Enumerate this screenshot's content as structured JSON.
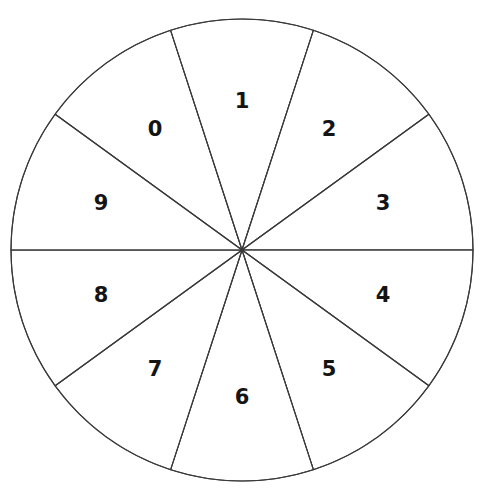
{
  "figure": {
    "name": "numbered-pie-wheel",
    "background_color": "#ffffff",
    "stroke_color": "#3a3a3a",
    "label_color": "#141414",
    "fill_color": "#ffffff"
  },
  "geometry": {
    "center_x": 242,
    "center_y": 250,
    "radius": 231,
    "sector_count": 10,
    "sector_angle_deg": 36,
    "label_radius": 148
  },
  "top_fragments": {
    "left": "",
    "right": ""
  },
  "chart_data": {
    "type": "pie",
    "title": "",
    "subtitle": "",
    "xlabel": "",
    "ylabel": "",
    "grid": false,
    "legend_position": "none",
    "annotations": [],
    "categories": [
      "0",
      "1",
      "2",
      "3",
      "4",
      "5",
      "6",
      "7",
      "8",
      "9"
    ],
    "values": [
      10,
      10,
      10,
      10,
      10,
      10,
      10,
      10,
      10,
      10
    ],
    "slice_angle_deg": 36,
    "total": 100,
    "slices": [
      {
        "label": "0",
        "value": 10,
        "percent": 10,
        "start_angle_deg": 108,
        "end_angle_deg": 144,
        "mid_angle_deg": 126,
        "label_x": 155,
        "label_y": 130,
        "fill": "#ffffff"
      },
      {
        "label": "1",
        "value": 10,
        "percent": 10,
        "start_angle_deg": 72,
        "end_angle_deg": 108,
        "mid_angle_deg": 90,
        "label_x": 242,
        "label_y": 102,
        "fill": "#ffffff"
      },
      {
        "label": "2",
        "value": 10,
        "percent": 10,
        "start_angle_deg": 36,
        "end_angle_deg": 72,
        "mid_angle_deg": 54,
        "label_x": 329,
        "label_y": 130,
        "fill": "#ffffff"
      },
      {
        "label": "3",
        "value": 10,
        "percent": 10,
        "start_angle_deg": 0,
        "end_angle_deg": 36,
        "mid_angle_deg": 18,
        "label_x": 383,
        "label_y": 204,
        "fill": "#ffffff"
      },
      {
        "label": "4",
        "value": 10,
        "percent": 10,
        "start_angle_deg": -36,
        "end_angle_deg": 0,
        "mid_angle_deg": -18,
        "label_x": 383,
        "label_y": 296,
        "fill": "#ffffff"
      },
      {
        "label": "5",
        "value": 10,
        "percent": 10,
        "start_angle_deg": -72,
        "end_angle_deg": -36,
        "mid_angle_deg": -54,
        "label_x": 329,
        "label_y": 370,
        "fill": "#ffffff"
      },
      {
        "label": "6",
        "value": 10,
        "percent": 10,
        "start_angle_deg": -108,
        "end_angle_deg": -72,
        "mid_angle_deg": -90,
        "label_x": 242,
        "label_y": 398,
        "fill": "#ffffff"
      },
      {
        "label": "7",
        "value": 10,
        "percent": 10,
        "start_angle_deg": -144,
        "end_angle_deg": -108,
        "mid_angle_deg": -126,
        "label_x": 155,
        "label_y": 370,
        "fill": "#ffffff"
      },
      {
        "label": "8",
        "value": 10,
        "percent": 10,
        "start_angle_deg": -180,
        "end_angle_deg": -144,
        "mid_angle_deg": -162,
        "label_x": 101,
        "label_y": 296,
        "fill": "#ffffff"
      },
      {
        "label": "9",
        "value": 10,
        "percent": 10,
        "start_angle_deg": 144,
        "end_angle_deg": 180,
        "mid_angle_deg": 162,
        "label_x": 101,
        "label_y": 204,
        "fill": "#ffffff"
      }
    ]
  }
}
